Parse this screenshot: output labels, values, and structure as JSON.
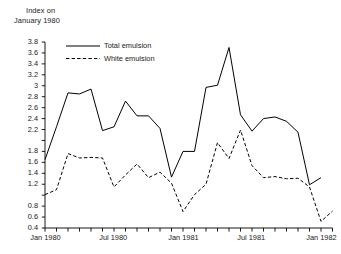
{
  "chart_data": {
    "type": "line",
    "title": "Index on January 1980",
    "title_lines": [
      "Index on",
      "January 1980"
    ],
    "xlabel": "",
    "ylabel": "Index on January 1980",
    "ylim": [
      0.4,
      3.8
    ],
    "ytick_step": 0.2,
    "grid": false,
    "legend_position": "top-left-inside",
    "x": [
      "Jan 1980",
      "Feb 1980",
      "Mar 1980",
      "Apr 1980",
      "May 1980",
      "Jun 1980",
      "Jul 1980",
      "Aug 1980",
      "Sep 1980",
      "Oct 1980",
      "Nov 1980",
      "Dec 1980",
      "Jan 1981",
      "Feb 1981",
      "Mar 1981",
      "Apr 1981",
      "May 1981",
      "Jun 1981",
      "Jul 1981",
      "Aug 1981",
      "Sep 1981",
      "Oct 1981",
      "Nov 1981",
      "Dec 1981",
      "Jan 1982",
      "Feb 1982"
    ],
    "ytick_labels": [
      "3.8",
      "3.6",
      "3.4",
      "3.2",
      "3",
      "2.8",
      "2.6",
      "2.4",
      "2.2",
      "",
      "1.8",
      "1.6",
      "1.4",
      "1.2",
      "",
      "0.8",
      "0.6",
      "0.4"
    ],
    "ytick_values": [
      3.8,
      3.6,
      3.4,
      3.2,
      3.0,
      2.8,
      2.6,
      2.4,
      2.2,
      2.0,
      1.8,
      1.6,
      1.4,
      1.2,
      1.0,
      0.8,
      0.6,
      0.4
    ],
    "xtick_labels": [
      "Jan 1980",
      "Jul 1980",
      "Jan 1981",
      "Jul 1981",
      "Jan 1982"
    ],
    "xtick_indices": [
      0,
      6,
      12,
      18,
      24
    ],
    "series": [
      {
        "name": "Total emulsion",
        "style": "solid",
        "color": "#000000",
        "values": [
          1.65,
          2.25,
          2.87,
          2.85,
          2.94,
          2.18,
          2.25,
          2.72,
          2.45,
          2.45,
          2.22,
          1.33,
          1.8,
          1.8,
          2.97,
          3.01,
          3.7,
          2.47,
          2.17,
          2.4,
          2.43,
          2.35,
          2.15,
          1.19,
          1.32,
          0.0
        ]
      },
      {
        "name": "White emulsion",
        "style": "dashed",
        "color": "#000000",
        "values": [
          1.01,
          1.1,
          1.76,
          1.68,
          1.69,
          1.68,
          1.15,
          1.37,
          1.57,
          1.32,
          1.42,
          1.22,
          0.7,
          1.01,
          1.2,
          1.96,
          1.67,
          2.19,
          1.54,
          1.32,
          1.34,
          1.3,
          1.31,
          1.15,
          0.52,
          0.71
        ]
      }
    ]
  },
  "legend": {
    "items": [
      {
        "label": "Total emulsion",
        "style": "solid"
      },
      {
        "label": "White emulsion",
        "style": "dashed"
      }
    ]
  }
}
